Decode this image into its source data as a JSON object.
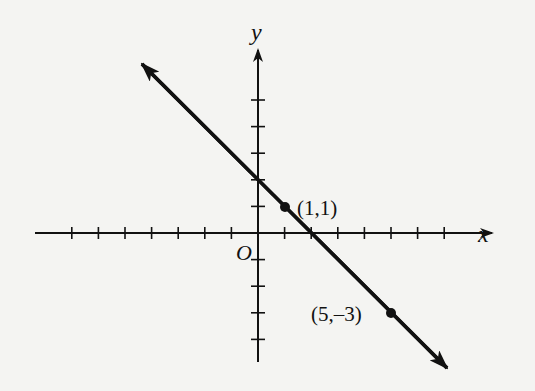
{
  "figure": {
    "colors": {
      "background": "#f4f4f2",
      "ink": "#111111"
    }
  },
  "axes": {
    "x_label": "x",
    "y_label": "y",
    "origin_label": "O",
    "x_ticks": [
      -7,
      -6,
      -5,
      -4,
      -3,
      -2,
      -1,
      1,
      2,
      3,
      4,
      5,
      6,
      7
    ],
    "y_ticks": [
      -4,
      -3,
      -2,
      -1,
      1,
      2,
      3,
      4,
      5
    ],
    "x_range": [
      -8.1,
      8.6
    ],
    "y_range": [
      -4.8,
      6.9
    ],
    "grid": false
  },
  "points": [
    {
      "label": "(1,1)",
      "x": 1,
      "y": 1
    },
    {
      "label": "(5,–3)",
      "x": 5,
      "y": -3
    }
  ],
  "line": {
    "slope": -1,
    "intercept": 2,
    "equation": "y = -x + 2",
    "arrows": "both"
  },
  "chart_data": {
    "type": "line",
    "title": "",
    "xlabel": "x",
    "ylabel": "y",
    "series": [
      {
        "name": "line",
        "x": [
          -4.35,
          7.1
        ],
        "y": [
          6.35,
          -5.1
        ]
      }
    ],
    "annotations": [
      {
        "text": "(1,1)",
        "x": 1,
        "y": 1
      },
      {
        "text": "(5,–3)",
        "x": 5,
        "y": -3
      },
      {
        "text": "O",
        "x": 0,
        "y": 0
      }
    ],
    "xlim": [
      -8.1,
      8.6
    ],
    "ylim": [
      -4.8,
      6.9
    ],
    "grid": false,
    "legend": "none"
  }
}
